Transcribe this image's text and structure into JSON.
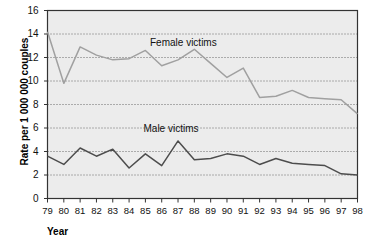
{
  "chart_data": {
    "type": "line",
    "title": "",
    "xlabel": "Year",
    "ylabel": "Rate per 1 000 000 couples",
    "categories": [
      "79",
      "80",
      "81",
      "82",
      "83",
      "84",
      "85",
      "86",
      "87",
      "88",
      "89",
      "90",
      "91",
      "92",
      "93",
      "94",
      "95",
      "96",
      "97",
      "98"
    ],
    "xlim": [
      79,
      98
    ],
    "ylim": [
      0,
      16
    ],
    "yticks": [
      "0",
      "2",
      "4",
      "6",
      "8",
      "10",
      "12",
      "14",
      "16"
    ],
    "grid": true,
    "grid_style": "dotted-horizontal",
    "legend_position": "inline-annotations",
    "plot_background": "#ececec",
    "series": [
      {
        "name": "Female victims",
        "color": "#a0a0a0",
        "label_x_year": 87.0,
        "label_y_value": 13.2,
        "values": [
          14.2,
          9.8,
          12.9,
          12.2,
          11.8,
          11.9,
          12.6,
          11.3,
          9.4,
          11.8,
          12.7,
          11.5,
          10.3,
          11.1,
          11.4,
          11.4,
          11.8,
          12.2,
          12.2,
          9.0
        ]
      },
      {
        "name": "Male victims",
        "color": "#4d4d4d",
        "label_x_year": 86.6,
        "label_y_value": 5.9,
        "values": [
          3.6,
          2.9,
          4.3,
          3.6,
          4.2,
          2.6,
          3.8,
          2.8,
          4.9,
          3.3,
          3.4,
          3.8,
          3.6,
          2.9,
          3.4,
          3.0,
          2.9,
          2.8,
          2.1,
          2.0
        ]
      }
    ],
    "series_tail_overrides": {
      "Female victims": [
        11.8,
        12.7,
        11.5,
        10.3,
        11.1,
        8.6,
        8.7,
        9.2,
        8.6,
        8.5,
        8.4,
        7.2
      ],
      "Male victims": [
        3.3,
        3.4,
        3.8,
        3.6,
        2.9,
        3.4,
        3.0,
        2.9,
        2.8,
        2.1,
        2.0
      ]
    }
  }
}
